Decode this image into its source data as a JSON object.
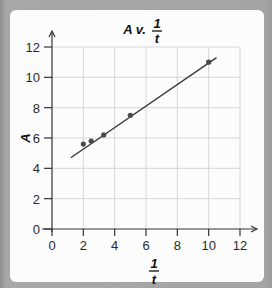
{
  "chart_data": {
    "type": "scatter",
    "title_parts": {
      "main": "A v.",
      "frac_num": "1",
      "frac_den": "t"
    },
    "xlabel": "1/t",
    "xlabel_parts": {
      "num": "1",
      "den": "t"
    },
    "ylabel": "A",
    "xlim": [
      0,
      12
    ],
    "ylim": [
      0,
      12
    ],
    "grid": true,
    "x_ticks": [
      0,
      2,
      4,
      6,
      8,
      10,
      12
    ],
    "y_ticks": [
      0,
      2,
      4,
      6,
      8,
      10,
      12
    ],
    "series": [
      {
        "name": "data points",
        "x": [
          2.0,
          2.5,
          3.3,
          5.0,
          10.0
        ],
        "y": [
          5.6,
          5.8,
          6.2,
          7.5,
          11.0
        ]
      }
    ],
    "fit_line": {
      "x": [
        1.2,
        10.5
      ],
      "y": [
        4.7,
        11.3
      ]
    },
    "colors": {
      "points": "#4a4a4a",
      "line": "#3a3a3a",
      "grid": "#d6d6d6",
      "axis": "#333333"
    }
  }
}
